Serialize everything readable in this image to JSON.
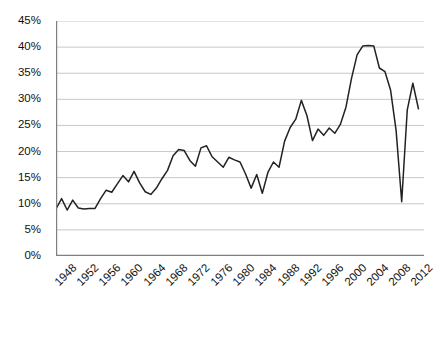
{
  "chart_data": {
    "type": "line",
    "title": "",
    "subtitle": "",
    "xlabel": "",
    "ylabel": "",
    "xlim": [
      1947,
      2013
    ],
    "ylim": [
      0,
      45
    ],
    "grid": true,
    "grid_axis": "y",
    "legend": false,
    "legend_position": "none",
    "line_color": "#222222",
    "grid_color": "#c8c8c8",
    "axis_color": "#7f7f7f",
    "background_color": "#ffffff",
    "y_ticks": [
      0,
      5,
      10,
      15,
      20,
      25,
      30,
      35,
      40,
      45
    ],
    "y_tick_labels": [
      "0%",
      "5%",
      "10%",
      "15%",
      "20%",
      "25%",
      "30%",
      "35%",
      "40%",
      "45%"
    ],
    "y_tick_suffix": "%",
    "x_ticks": [
      1948,
      1952,
      1956,
      1960,
      1964,
      1968,
      1972,
      1976,
      1980,
      1984,
      1988,
      1992,
      1996,
      2000,
      2004,
      2008,
      2012
    ],
    "x_tick_labels": [
      "1948",
      "1952",
      "1956",
      "1960",
      "1964",
      "1968",
      "1972",
      "1976",
      "1980",
      "1984",
      "1988",
      "1992",
      "1996",
      "2000",
      "2004",
      "2008",
      "2012"
    ],
    "x_tick_rotation": -45,
    "x_tick_step": 4,
    "series": [
      {
        "name": "series-1",
        "color": "#222222",
        "x": [
          1947,
          1948,
          1949,
          1950,
          1951,
          1952,
          1953,
          1954,
          1955,
          1956,
          1957,
          1958,
          1959,
          1960,
          1961,
          1962,
          1963,
          1964,
          1965,
          1966,
          1967,
          1968,
          1969,
          1970,
          1971,
          1972,
          1973,
          1974,
          1975,
          1976,
          1977,
          1978,
          1979,
          1980,
          1981,
          1982,
          1983,
          1984,
          1985,
          1986,
          1987,
          1988,
          1989,
          1990,
          1991,
          1992,
          1993,
          1994,
          1995,
          1996,
          1997,
          1998,
          1999,
          2000,
          2001,
          2002,
          2003,
          2004,
          2005,
          2006,
          2007,
          2008,
          2009,
          2010,
          2011,
          2012
        ],
        "values": [
          9.0,
          11.0,
          8.8,
          10.7,
          9.2,
          9.0,
          9.1,
          9.1,
          11.0,
          12.6,
          12.2,
          13.8,
          15.4,
          14.2,
          16.2,
          14.0,
          12.3,
          11.8,
          13.0,
          14.8,
          16.4,
          19.2,
          20.4,
          20.2,
          18.3,
          17.2,
          20.7,
          21.1,
          19.0,
          18.0,
          17.0,
          18.9,
          18.4,
          18.0,
          15.7,
          13.0,
          15.6,
          12.0,
          16.0,
          18.0,
          17.0,
          22.0,
          24.6,
          26.2,
          29.8,
          26.9,
          22.1,
          24.3,
          23.1,
          24.5,
          23.5,
          25.2,
          28.5,
          34.0,
          38.5,
          40.2,
          40.3,
          40.2,
          36.0,
          35.3,
          31.8,
          24.0,
          10.4,
          28.0,
          33.1,
          28.2
        ]
      }
    ]
  }
}
